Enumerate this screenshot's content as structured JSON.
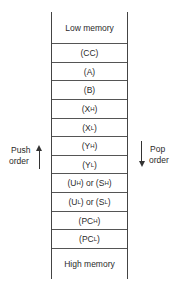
{
  "diagram": {
    "type": "stack-memory-layout",
    "cells": [
      {
        "label": "Low memory"
      },
      {
        "label": "(CC)"
      },
      {
        "label": "(A)"
      },
      {
        "label": "(B)"
      },
      {
        "label": "(X",
        "sub": "H",
        "suffix": ")"
      },
      {
        "label": "(X",
        "sub": "L",
        "suffix": ")"
      },
      {
        "label": "(Y",
        "sub": "H",
        "suffix": ")"
      },
      {
        "label": "(Y",
        "sub": "L",
        "suffix": ")"
      },
      {
        "label": "(U",
        "sub": "H",
        "mid": ") or (S",
        "sub2": "H",
        "suffix": ")"
      },
      {
        "label": "(U",
        "sub": "L",
        "mid": ") or (S",
        "sub2": "L",
        "suffix": ")"
      },
      {
        "label": "(PC",
        "sub": "H",
        "suffix": ")"
      },
      {
        "label": "(PC",
        "sub": "L",
        "suffix": ")"
      },
      {
        "label": "High memory"
      }
    ],
    "push": {
      "line1": "Push",
      "line2": "order",
      "direction": "up"
    },
    "pop": {
      "line1": "Pop",
      "line2": "order",
      "direction": "down"
    }
  }
}
